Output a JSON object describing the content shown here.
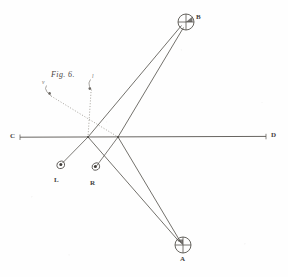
{
  "figure": {
    "caption": "Fig. 6.",
    "background_color": "#fefefe",
    "ink_color": "#55524e",
    "dotted_ink_color": "#8b8781",
    "label_color": "#43413e",
    "width": 288,
    "height": 277
  },
  "points": {
    "B": {
      "label": "B",
      "x": 186,
      "y": 22,
      "marker": "crosshair-circle",
      "radius": 8
    },
    "A": {
      "label": "A",
      "x": 183,
      "y": 245,
      "marker": "crosshair-circle",
      "radius": 8
    },
    "C": {
      "label": "C",
      "x": 17,
      "y": 137,
      "marker": "line-end"
    },
    "D": {
      "label": "D",
      "x": 270,
      "y": 137,
      "marker": "line-end"
    },
    "L": {
      "label": "L",
      "x": 59,
      "y": 165,
      "marker": "eye-symbol"
    },
    "R": {
      "label": "R",
      "x": 94,
      "y": 168,
      "marker": "eye-symbol"
    },
    "X1": {
      "label": "",
      "x": 88,
      "y": 137,
      "marker": "crossing"
    },
    "X2": {
      "label": "",
      "x": 118,
      "y": 137,
      "marker": "crossing"
    },
    "v1": {
      "label": "v",
      "x": 47,
      "y": 88,
      "marker": "hook-symbol"
    },
    "v2": {
      "label": "l",
      "x": 89,
      "y": 83,
      "marker": "hook-symbol"
    }
  },
  "labels": {
    "point_b": "B",
    "point_a": "A",
    "point_c": "C",
    "point_d": "D",
    "eye_left": "L",
    "eye_right": "R",
    "caption": "Fig. 6.",
    "tiny_left": "v",
    "tiny_right": "l"
  },
  "lines": {
    "baseline": {
      "name": "C-D axis",
      "from": "C",
      "to": "D",
      "style": "solid"
    },
    "solid_rays": [
      {
        "name": "X1 to B",
        "from": "X1",
        "to": "B"
      },
      {
        "name": "X2 to B",
        "from": "X2",
        "to": "B"
      },
      {
        "name": "X1 to A",
        "from": "X1",
        "to": "A"
      },
      {
        "name": "X2 to A",
        "from": "X2",
        "to": "A"
      },
      {
        "name": "X1 to L",
        "from": "X1",
        "to": "L"
      },
      {
        "name": "X2 to R",
        "from": "X2",
        "to": "R"
      }
    ],
    "dotted_rays": [
      {
        "name": "v1 to X2",
        "from": "v1",
        "to": "X2"
      },
      {
        "name": "v2 to X1",
        "from": "v2",
        "to": "X1"
      }
    ]
  }
}
